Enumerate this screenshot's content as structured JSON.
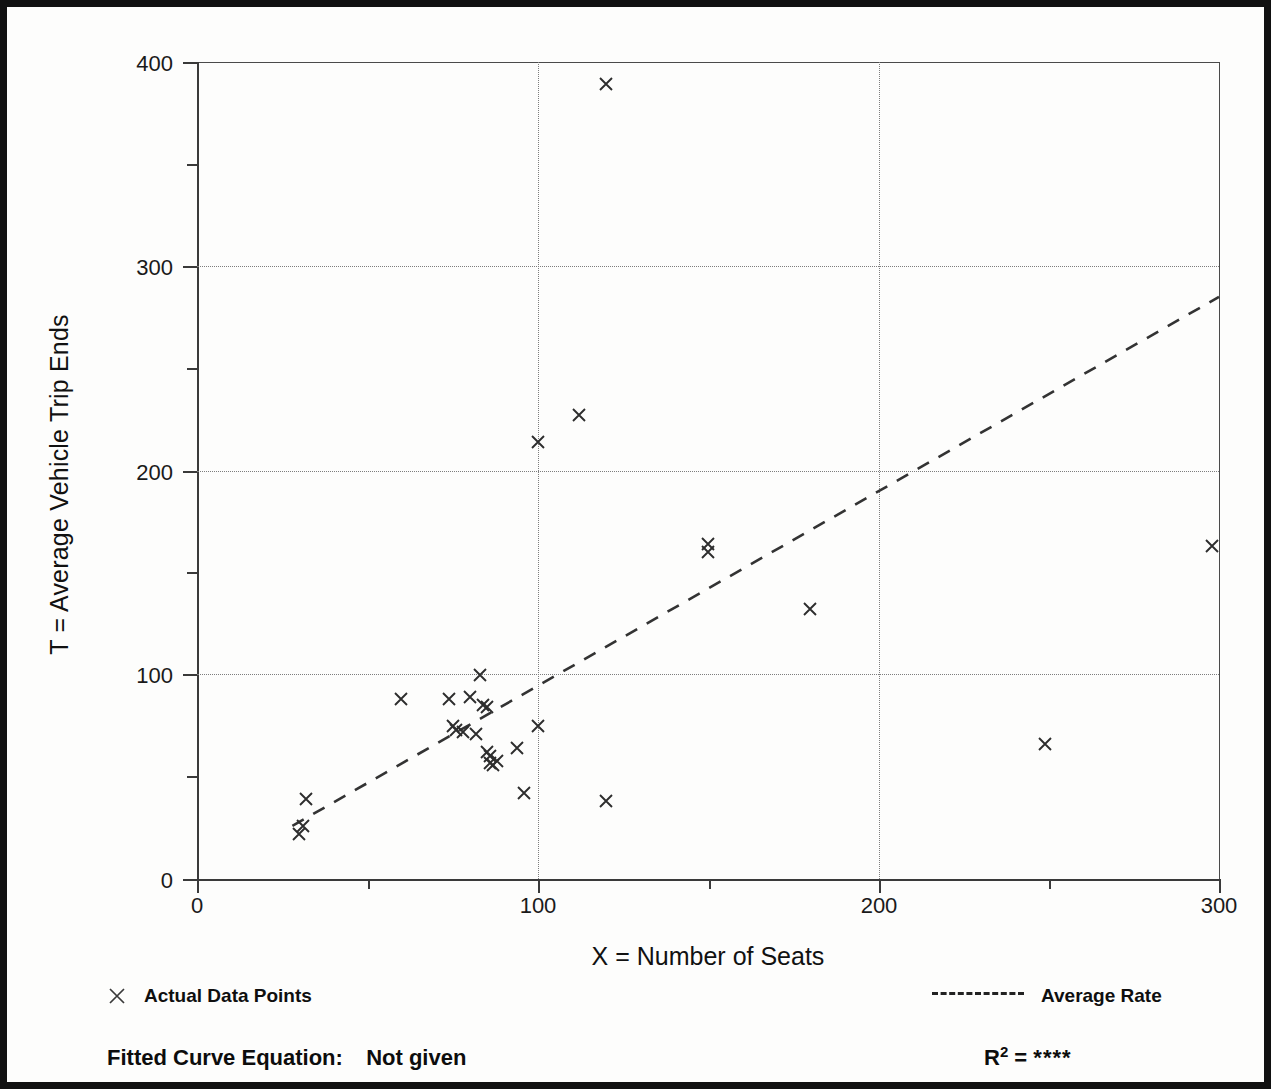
{
  "figure": {
    "background_color": "#ffffff",
    "border_color": "#111111",
    "marker_color": "#2d2d2d",
    "grid_color": "#7d7d7d"
  },
  "axes": {
    "x_title": "X = Number of Seats",
    "y_title": "T = Average Vehicle Trip Ends",
    "x_ticks": [
      "0",
      "100",
      "200",
      "300"
    ],
    "y_ticks": [
      "0",
      "100",
      "200",
      "300",
      "400"
    ]
  },
  "legend": {
    "data_points_label": "Actual Data Points",
    "data_points_marker": "x-marker-icon",
    "average_rate_label": "Average Rate",
    "average_rate_marker": "dashed-line-icon"
  },
  "footer": {
    "equation_label": "Fitted Curve Equation:",
    "equation_value": "Not given",
    "r2_label": "R",
    "r2_exponent": "2",
    "r2_equals": "=",
    "r2_value": "****"
  },
  "chart_data": {
    "type": "scatter",
    "title": "",
    "xlabel": "X = Number of Seats",
    "ylabel": "T = Average Vehicle Trip Ends",
    "xlim": [
      0,
      300
    ],
    "ylim": [
      0,
      400
    ],
    "xticks": [
      0,
      100,
      200,
      300
    ],
    "yticks": [
      0,
      100,
      200,
      300,
      400
    ],
    "x_minor_ticks": [
      50,
      150,
      250
    ],
    "y_minor_ticks": [
      50,
      150,
      250,
      350
    ],
    "grid": true,
    "gridlines_x": [
      100,
      200
    ],
    "gridlines_y": [
      100,
      200,
      300
    ],
    "legend_position": "below-axes",
    "series": [
      {
        "name": "Actual Data Points",
        "type": "scatter",
        "marker": "x",
        "points": [
          [
            30,
            22
          ],
          [
            31,
            26
          ],
          [
            32,
            39
          ],
          [
            60,
            88
          ],
          [
            74,
            88
          ],
          [
            75,
            75
          ],
          [
            76,
            73
          ],
          [
            78,
            72
          ],
          [
            80,
            89
          ],
          [
            82,
            71
          ],
          [
            83,
            100
          ],
          [
            84,
            85
          ],
          [
            85,
            84
          ],
          [
            85,
            62
          ],
          [
            86,
            60
          ],
          [
            86,
            57
          ],
          [
            87,
            56
          ],
          [
            88,
            58
          ],
          [
            94,
            64
          ],
          [
            96,
            42
          ],
          [
            100,
            75
          ],
          [
            100,
            214
          ],
          [
            112,
            227
          ],
          [
            120,
            38
          ],
          [
            120,
            389
          ],
          [
            150,
            160
          ],
          [
            150,
            164
          ],
          [
            180,
            132
          ],
          [
            249,
            66
          ],
          [
            298,
            163
          ]
        ]
      },
      {
        "name": "Average Rate",
        "type": "line",
        "style": "dashed",
        "x": [
          28,
          300
        ],
        "y": [
          26,
          285
        ],
        "note": "average rate ray through origin, slope approx 0.95 trips per seat"
      }
    ]
  }
}
